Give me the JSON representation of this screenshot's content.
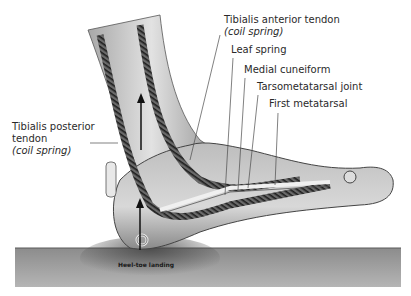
{
  "figure": {
    "type": "anatomical illustration",
    "labels": {
      "tibialis_anterior": {
        "line1": "Tibialis anterior tendon",
        "line2": "(coil spring)"
      },
      "leaf_spring": "Leaf spring",
      "medial_cuneiform": "Medial cuneiform",
      "tarsometatarsal_joint": "Tarsometatarsal joint",
      "first_metatarsal": "First metatarsal",
      "tibialis_posterior": {
        "line1": "Tibialis posterior",
        "line2": "tendon",
        "line3": "(coil spring)"
      },
      "ground": "Heel-toe landing"
    },
    "colors": {
      "ground": "#9a9a9a",
      "skin": "#c8c8c8",
      "tendon": "#3a3a3a",
      "leader_line": "#4a4a4a"
    }
  }
}
